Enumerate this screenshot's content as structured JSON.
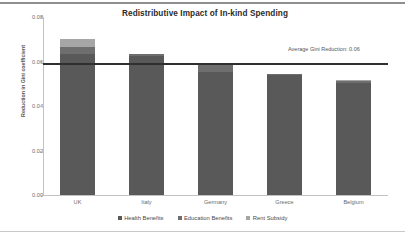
{
  "chart_data": {
    "type": "bar",
    "stacked": true,
    "title": "Redistributive Impact of In-kind Spending",
    "xlabel": "",
    "ylabel": "Reduction in Gini coefficient",
    "categories": [
      "UK",
      "Italy",
      "Germany",
      "Greece",
      "Belgium"
    ],
    "series": [
      {
        "name": "Health Benefits",
        "color": "#595959",
        "values": [
          0.0635,
          0.0625,
          0.0555,
          0.054,
          0.0505
        ]
      },
      {
        "name": "Education Benefits",
        "color": "#6e6e6e",
        "values": [
          0.003,
          0.001,
          0.0035,
          0.0005,
          0.0008
        ]
      },
      {
        "name": "Rent Subsidy",
        "color": "#a6a6a6",
        "values": [
          0.0035,
          0.0,
          0.0005,
          0.0,
          0.0002
        ]
      }
    ],
    "totals": [
      0.07,
      0.0635,
      0.0595,
      0.0545,
      0.0515
    ],
    "ylim": [
      0.0,
      0.08
    ],
    "yticks": [
      "0.00",
      "0.02",
      "0.04",
      "0.06",
      "0.08"
    ],
    "ytick_values": [
      0.0,
      0.02,
      0.04,
      0.06,
      0.08
    ],
    "grid": false,
    "legend_position": "bottom",
    "annotations": [
      {
        "name": "average-gini-reduction",
        "text": "Average Gini Reduction: 0.06",
        "value": 0.0595,
        "line_color": "#2f2f2f"
      }
    ]
  }
}
